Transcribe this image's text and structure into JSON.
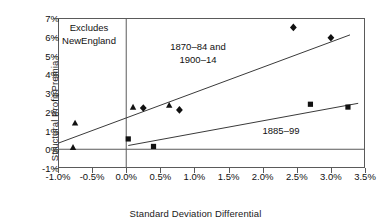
{
  "chart_data": {
    "type": "scatter",
    "title": "",
    "xlabel": "Standard Deviation Differential",
    "ylabel": "Structural Profit Premia",
    "xlim": [
      -1.0,
      3.5
    ],
    "ylim": [
      -1,
      7
    ],
    "grid": false,
    "legend": "none",
    "xticks": [
      "-1.0%",
      "-0.5%",
      "0.0%",
      "0.5%",
      "1.0%",
      "1.5%",
      "2.0%",
      "2.5%",
      "3.0%",
      "3.5%"
    ],
    "xtick_values": [
      -1.0,
      -0.5,
      0.0,
      0.5,
      1.0,
      1.5,
      2.0,
      2.5,
      3.0,
      3.5
    ],
    "yticks": [
      "-1%",
      "0%",
      "1%",
      "2%",
      "3%",
      "4%",
      "5%",
      "6%",
      "7%"
    ],
    "ytick_values": [
      -1,
      0,
      1,
      2,
      3,
      4,
      5,
      6,
      7
    ],
    "annotations": [
      {
        "name": "excludes-note",
        "text_lines": [
          "Excludes",
          "NewEngland"
        ]
      },
      {
        "name": "series-a-note",
        "text_lines": [
          "1870–84 and",
          "1900–14"
        ]
      },
      {
        "name": "series-b-note",
        "text_lines": [
          "1885–99"
        ]
      }
    ],
    "series": [
      {
        "name": "1870–84 and 1900–14",
        "marker": "triangle",
        "points": [
          {
            "x": -0.75,
            "y": 1.4
          },
          {
            "x": -0.78,
            "y": 0.1
          },
          {
            "x": 0.1,
            "y": 2.25
          },
          {
            "x": 0.63,
            "y": 2.35
          }
        ]
      },
      {
        "name": "1870–84 and 1900–14",
        "marker": "diamond",
        "points": [
          {
            "x": 0.25,
            "y": 2.2
          },
          {
            "x": 0.78,
            "y": 2.1
          },
          {
            "x": 2.45,
            "y": 6.5
          },
          {
            "x": 3.0,
            "y": 5.95
          }
        ]
      },
      {
        "name": "1885–99",
        "marker": "square",
        "points": [
          {
            "x": 0.03,
            "y": 0.55
          },
          {
            "x": 0.4,
            "y": 0.15
          },
          {
            "x": 2.7,
            "y": 2.4
          },
          {
            "x": 3.25,
            "y": 2.25
          }
        ]
      }
    ],
    "trendlines": [
      {
        "name": "1870–84 and 1900–14",
        "x0": -1.0,
        "y0": 0.32,
        "x1": 3.28,
        "y1": 6.1
      },
      {
        "name": "1885–99",
        "x0": 0.03,
        "y0": 0.2,
        "x1": 3.4,
        "y1": 2.45
      }
    ],
    "reference_lines": [
      {
        "name": "zero-horizontal",
        "axis": "y",
        "value": 0
      },
      {
        "name": "zero-vertical",
        "axis": "x",
        "value": 0.0
      }
    ],
    "colors": {
      "marker": "#111111",
      "line": "#3a3a3a",
      "frame": "#5a5a5a",
      "text": "#111111"
    }
  }
}
